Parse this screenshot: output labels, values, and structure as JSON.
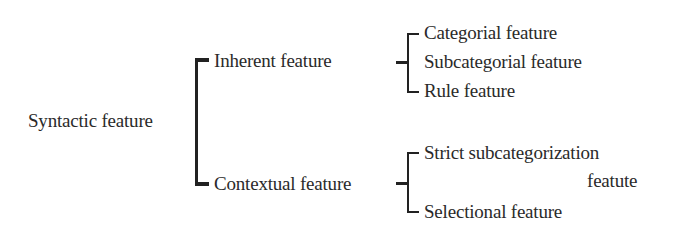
{
  "diagram": {
    "root": "Syntactic feature",
    "branches": [
      {
        "label": "Inherent feature",
        "children": [
          "Categorial feature",
          "Subcategorial feature",
          "Rule feature"
        ]
      },
      {
        "label": "Contextual feature",
        "children": [
          "Strict subcategorization",
          "featute",
          "Selectional feature"
        ]
      }
    ]
  }
}
